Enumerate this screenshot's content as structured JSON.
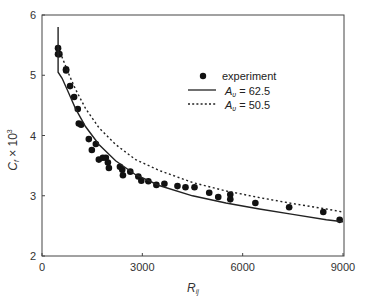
{
  "chart_data": {
    "type": "scatter",
    "title": "",
    "xlabel": "R_ij",
    "ylabel": "C_f × 10^3",
    "xlim": [
      0,
      9000
    ],
    "ylim": [
      2,
      6
    ],
    "xticks": [
      0,
      3000,
      6000,
      9000
    ],
    "yticks": [
      2,
      3,
      4,
      5,
      6
    ],
    "grid": false,
    "legend_position": "upper right (inside)",
    "series": [
      {
        "name": "experiment",
        "style": "filled-circle",
        "x": [
          480,
          480,
          520,
          720,
          720,
          840,
          960,
          1070,
          1100,
          1170,
          1400,
          1610,
          1490,
          1700,
          1820,
          1910,
          1970,
          2000,
          2330,
          2420,
          2400,
          2640,
          2880,
          2970,
          3180,
          3420,
          3660,
          4050,
          4290,
          4560,
          5000,
          5270,
          5630,
          5630,
          6380,
          7390,
          8410,
          8900
        ],
        "y": [
          5.45,
          5.35,
          5.35,
          5.1,
          5.08,
          4.82,
          4.64,
          4.44,
          4.2,
          4.18,
          3.94,
          3.86,
          3.76,
          3.6,
          3.63,
          3.63,
          3.55,
          3.46,
          3.48,
          3.34,
          3.43,
          3.4,
          3.32,
          3.25,
          3.24,
          3.18,
          3.2,
          3.16,
          3.14,
          3.14,
          3.05,
          2.98,
          3.02,
          2.94,
          2.88,
          2.81,
          2.73,
          2.6
        ]
      },
      {
        "name": "A_υ = 62.5",
        "style": "solid-line",
        "x": [
          480,
          480,
          600,
          800,
          1000,
          1300,
          1700,
          2200,
          2800,
          3500,
          4500,
          5500,
          6500,
          7500,
          8500,
          9000
        ],
        "y": [
          5.8,
          5.05,
          4.95,
          4.7,
          4.45,
          4.15,
          3.85,
          3.58,
          3.35,
          3.17,
          3.0,
          2.88,
          2.78,
          2.69,
          2.6,
          2.57
        ]
      },
      {
        "name": "A_υ = 50.5",
        "style": "dotted-line",
        "x": [
          480,
          600,
          800,
          1000,
          1300,
          1700,
          2200,
          2800,
          3500,
          4500,
          5500,
          6500,
          7500,
          8500,
          9000
        ],
        "y": [
          5.45,
          5.3,
          5.02,
          4.77,
          4.45,
          4.13,
          3.85,
          3.6,
          3.42,
          3.22,
          3.08,
          2.97,
          2.87,
          2.78,
          2.73
        ]
      }
    ]
  },
  "legend": {
    "experiment": "experiment",
    "solid_prefix": "A",
    "solid_sub": "υ",
    "solid_value": " = 62.5",
    "dotted_prefix": "A",
    "dotted_sub": "υ",
    "dotted_value": " = 50.5"
  },
  "axes": {
    "x_label_main": "R",
    "x_label_sub": "ij",
    "y_label_main": "C",
    "y_label_sub": "f",
    "y_label_rest": " × 10",
    "y_label_sup": "3",
    "x_tick_labels": [
      "0",
      "3000",
      "6000",
      "9000"
    ],
    "y_tick_labels": [
      "2",
      "3",
      "4",
      "5",
      "6"
    ]
  }
}
